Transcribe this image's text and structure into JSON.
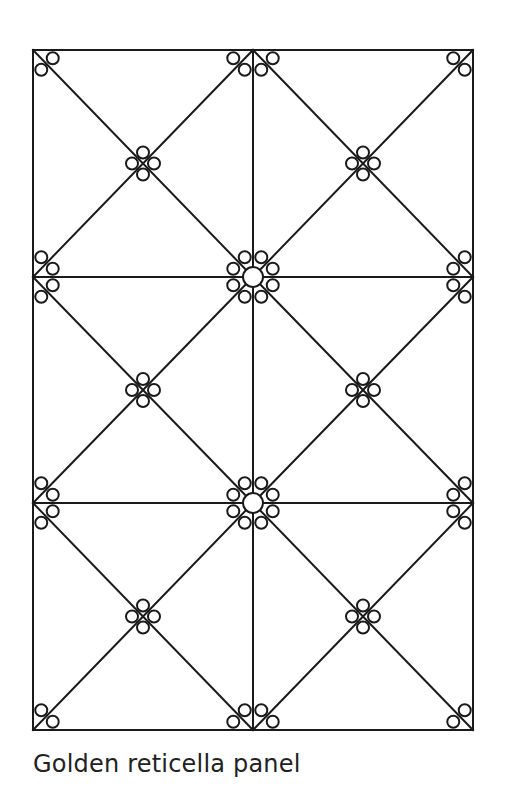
{
  "caption": "Golden reticella panel",
  "colors": {
    "stroke": "#1a1a1a",
    "background": "#ffffff",
    "caption": "#222222"
  },
  "panel": {
    "frame": {
      "x1": 33,
      "y1": 50,
      "x2": 473,
      "y2": 730
    },
    "vertical_divider_x": 253,
    "horizontal_dividers_y": [
      277,
      503
    ],
    "columns": 2,
    "rows": 3,
    "small_ring_radius": 6,
    "large_ring_radius": 10,
    "large_ring_centers": [
      [
        253,
        277
      ],
      [
        253,
        503
      ]
    ]
  }
}
